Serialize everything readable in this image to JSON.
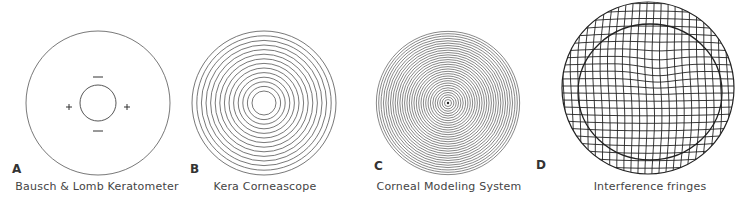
{
  "figure": {
    "panels": [
      {
        "letter": "A",
        "caption": "Bausch & Lomb Keratometer",
        "type": "keratometer-mires",
        "outer_radius": 72,
        "inner_radius": 18,
        "markers": {
          "plus": "+",
          "minus": "—"
        }
      },
      {
        "letter": "B",
        "caption": "Kera Corneascope",
        "type": "placido-rings",
        "ring_count": 13
      },
      {
        "letter": "C",
        "caption": "Corneal Modeling System",
        "type": "dense-placido-rings",
        "ring_count": 30
      },
      {
        "letter": "D",
        "caption": "Interference fringes",
        "type": "interference-grid"
      }
    ],
    "line_color": "#3a3a3a"
  }
}
